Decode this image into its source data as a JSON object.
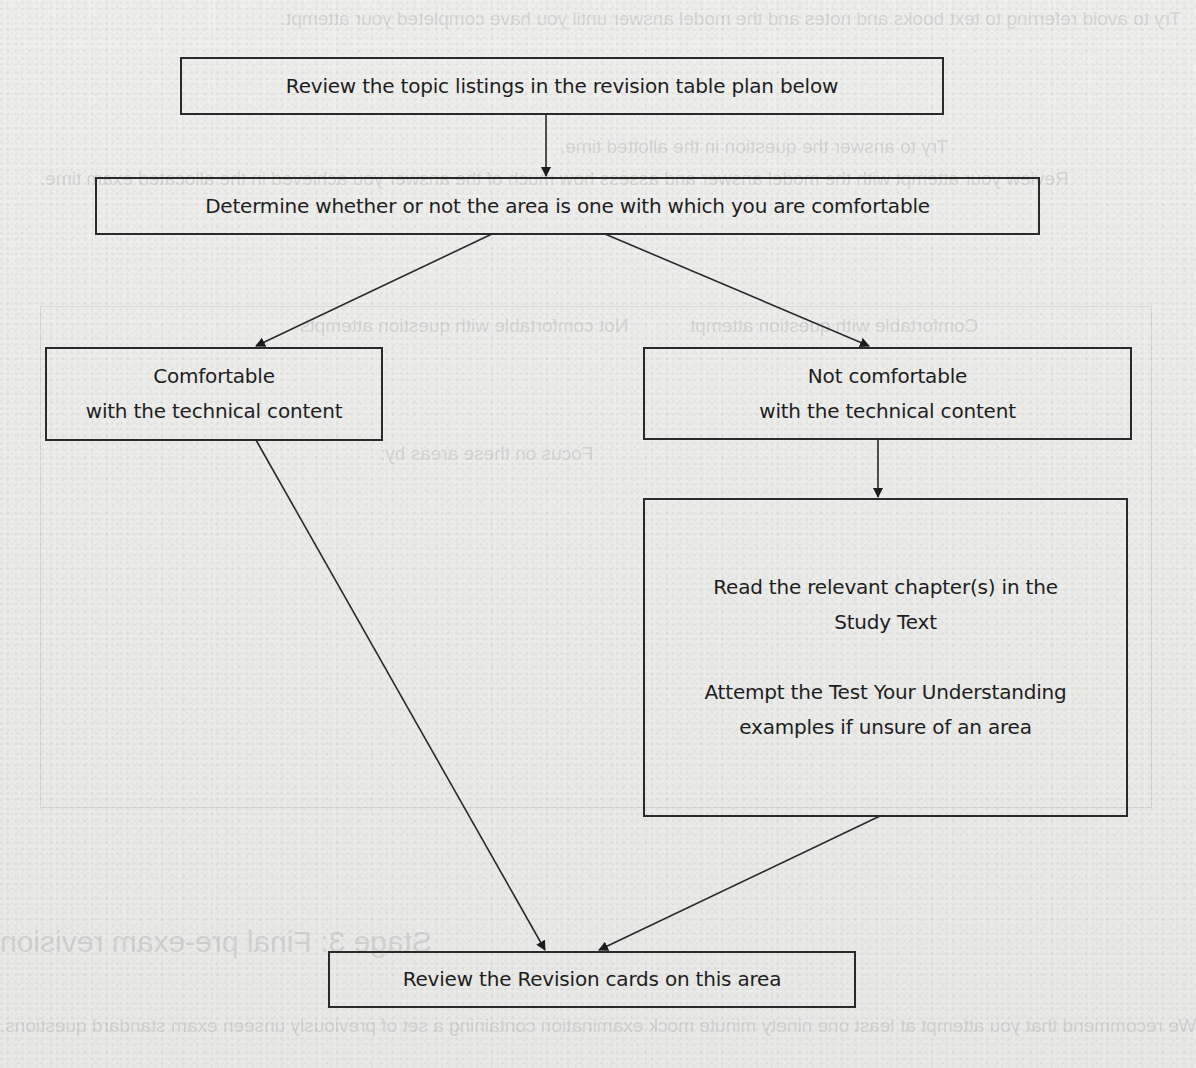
{
  "diagram": {
    "type": "flowchart",
    "nodes": {
      "review_topics": {
        "lines": [
          "Review the topic listings in the revision table plan below"
        ]
      },
      "determine_comfort": {
        "lines": [
          "Determine whether or not the area is one with which you are comfortable"
        ]
      },
      "comfortable": {
        "lines": [
          "Comfortable",
          "with the technical content"
        ]
      },
      "not_comfortable": {
        "lines": [
          "Not comfortable",
          "with the technical content"
        ]
      },
      "read_chapters": {
        "paragraphs": [
          [
            "Read the relevant chapter(s) in the",
            "Study Text"
          ],
          [
            "Attempt the Test Your Understanding",
            "examples if unsure of an area"
          ]
        ]
      },
      "review_cards": {
        "lines": [
          "Review the Revision cards on this area"
        ]
      }
    },
    "edges": [
      {
        "from": "review_topics",
        "to": "determine_comfort"
      },
      {
        "from": "determine_comfort",
        "to": "comfortable"
      },
      {
        "from": "determine_comfort",
        "to": "not_comfortable"
      },
      {
        "from": "not_comfortable",
        "to": "read_chapters"
      },
      {
        "from": "comfortable",
        "to": "review_cards"
      },
      {
        "from": "read_chapters",
        "to": "review_cards"
      }
    ]
  },
  "background": {
    "description": "Scanned page with faint mirrored bleed-through text from reverse side",
    "ghost_heading": "Stage 3: Final pre-exam revision",
    "ghost_lines": [
      "Try to avoid referring to text books and notes and the model answer until you have completed your attempt.",
      "Try to answer the question in the allotted time.",
      "Review your attempt with the model answer and assess how much of the answer you achieved in the allocated exam time.",
      "Comfortable with question attempt",
      "Not comfortable with question attempts",
      "Focus on these areas by:",
      "Reworking test your understanding examples in the Study Text",
      "Revisiting the technical content from the Revision cards",
      "Working any remaining questions on that area in the Exam Practice Kit",
      "Re-attempting an exam standard question in that area, on a timed, closed book basis",
      "Only revisit when comfortable with questions on all topic areas",
      "We recommend that you attempt at least one ninety minute mock examination containing a set of previously unseen exam standard questions."
    ]
  },
  "colors": {
    "page": "#ececea",
    "stroke": "#2a2a2a",
    "text": "#1e1e1e"
  }
}
